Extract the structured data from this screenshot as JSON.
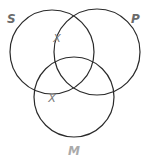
{
  "diagram": {
    "type": "venn",
    "sets": [
      {
        "id": "S",
        "label": "S",
        "cx": 52,
        "cy": 52,
        "r": 42,
        "label_x": 7,
        "label_y": 23,
        "label_color": "#6a6a6a"
      },
      {
        "id": "P",
        "label": "P",
        "cx": 97,
        "cy": 52,
        "r": 43,
        "label_x": 131,
        "label_y": 23,
        "label_color": "#6a6a6a"
      },
      {
        "id": "M",
        "label": "M",
        "cx": 74,
        "cy": 97,
        "r": 40,
        "label_x": 68,
        "label_y": 155,
        "label_color": "#aaaaaa"
      }
    ],
    "marks": [
      {
        "symbol": "X",
        "x": 57,
        "y": 38,
        "color": "#777777",
        "position": "on S boundary inside P, outside M"
      },
      {
        "symbol": "X",
        "x": 52,
        "y": 98,
        "color": "#777777",
        "position": "on S boundary inside M, outside P"
      }
    ],
    "stroke_color": "#2a2a2a"
  }
}
